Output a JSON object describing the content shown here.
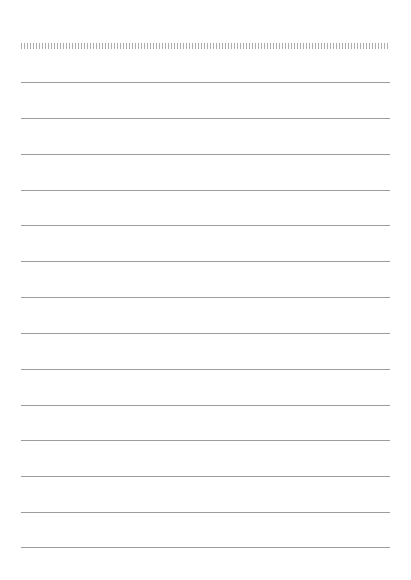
{
  "page": {
    "type": "lined-paper",
    "background": "#ffffff",
    "line_color": "#9c9c9c",
    "perforation": true,
    "line_count": 14,
    "line_positions": [
      82,
      118,
      154,
      190,
      225,
      261,
      297,
      333,
      369,
      405,
      440,
      476,
      512,
      547
    ]
  }
}
